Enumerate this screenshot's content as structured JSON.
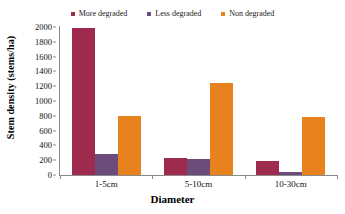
{
  "chart_data": {
    "type": "bar",
    "title": "",
    "xlabel": "Diameter",
    "ylabel": "Stem density (stems/ha)",
    "categories": [
      "1-5cm",
      "5-10cm",
      "10-30cm"
    ],
    "series": [
      {
        "name": "More degraded",
        "color": "#9E2B4E",
        "values": [
          1980,
          230,
          185
        ]
      },
      {
        "name": "Less degraded",
        "color": "#6B4C7A",
        "values": [
          290,
          210,
          40
        ]
      },
      {
        "name": "Non  degraded",
        "color": "#E8821E",
        "values": [
          800,
          1250,
          790
        ]
      }
    ],
    "ylim": [
      0,
      2000
    ],
    "ytick_step": 200,
    "yticks": [
      0,
      200,
      400,
      600,
      800,
      1000,
      1200,
      1400,
      1600,
      1800,
      2000
    ],
    "ytick_labels": [
      "0",
      "200",
      "400",
      "600",
      "800",
      "1000",
      "1200",
      "1400",
      "1600",
      "1800",
      "2000"
    ],
    "grid": false,
    "legend_position": "top"
  },
  "legend": {
    "entries": [
      {
        "label": "More degraded",
        "color": "#9E2B4E"
      },
      {
        "label": "Less degraded",
        "color": "#6B4C7A"
      },
      {
        "label": "Non  degraded",
        "color": "#E8821E"
      }
    ]
  },
  "axes": {
    "y_title": "Stem density (stems/ha)",
    "x_title": "Diameter"
  }
}
